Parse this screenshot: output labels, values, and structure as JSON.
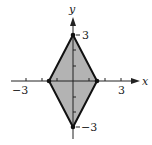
{
  "diagram": {
    "type": "coordinate-plane-region",
    "x_axis": {
      "label": "x",
      "range": [
        -4,
        4
      ],
      "tick_labels": [
        {
          "value": -3,
          "text": "−3"
        },
        {
          "value": 3,
          "text": "3"
        }
      ]
    },
    "y_axis": {
      "label": "y",
      "range": [
        -3.5,
        4
      ],
      "tick_labels": [
        {
          "value": 3,
          "text": "3"
        },
        {
          "value": -3,
          "text": "−3"
        }
      ]
    },
    "vertices": [
      {
        "x": 0,
        "y": 3
      },
      {
        "x": 1.5,
        "y": 0
      },
      {
        "x": 0,
        "y": -3
      },
      {
        "x": -1.5,
        "y": 0
      }
    ],
    "fill_color": "#b0b0b0",
    "edge_color": "#111111"
  }
}
